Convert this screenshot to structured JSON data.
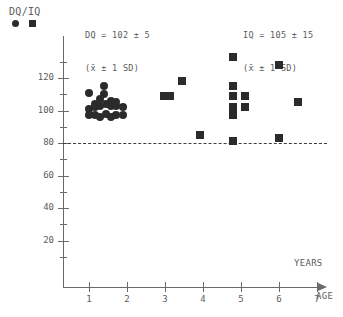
{
  "legend": {
    "title": "DQ/IQ",
    "circle_name": "circle-marker",
    "square_name": "square-marker"
  },
  "annotations": {
    "dq_line1": "DQ = 102 ± 5",
    "dq_line2": "(x̄ ± 1 SD)",
    "iq_line1": "IQ = 105 ± 15",
    "iq_line2": "(x̄ ± 1 SD)",
    "years_label": "YEARS",
    "age_label": "AGE"
  },
  "colors": {
    "marker": "#2b2b2b",
    "axis": "#6a6a6a",
    "text": "#5b5b5b",
    "reference_line": "#3d3d3d",
    "background": "#ffffff"
  },
  "chart_data": {
    "type": "scatter",
    "title": "",
    "xlabel": "AGE",
    "ylabel": "DQ/IQ",
    "xlim": [
      0,
      7.7
    ],
    "ylim": [
      0,
      136
    ],
    "grid": false,
    "legend_position": "top-left",
    "y_ticks_major": [
      20,
      40,
      60,
      80,
      100,
      120
    ],
    "y_ticks_minor": [
      10,
      30,
      50,
      70,
      90,
      110,
      130
    ],
    "x_ticks": [
      1,
      2,
      3,
      4,
      5,
      6,
      7
    ],
    "x_tick_labels": [
      "1",
      "2",
      "3",
      "4",
      "5",
      "6",
      "7"
    ],
    "y_tick_labels": [
      "20",
      "40",
      "60",
      "80",
      "100",
      "120"
    ],
    "reference_line": {
      "y": 80,
      "style": "dashed",
      "label": ""
    },
    "series": [
      {
        "name": "DQ",
        "marker": "circle",
        "mean": 102,
        "sd": 5,
        "points": [
          {
            "x": 1.0,
            "y": 111
          },
          {
            "x": 1.0,
            "y": 101
          },
          {
            "x": 1.0,
            "y": 97
          },
          {
            "x": 1.17,
            "y": 104
          },
          {
            "x": 1.17,
            "y": 102
          },
          {
            "x": 1.17,
            "y": 97
          },
          {
            "x": 1.3,
            "y": 107
          },
          {
            "x": 1.3,
            "y": 103
          },
          {
            "x": 1.3,
            "y": 96
          },
          {
            "x": 1.4,
            "y": 115
          },
          {
            "x": 1.4,
            "y": 110
          },
          {
            "x": 1.45,
            "y": 104
          },
          {
            "x": 1.45,
            "y": 98
          },
          {
            "x": 1.58,
            "y": 106
          },
          {
            "x": 1.58,
            "y": 103
          },
          {
            "x": 1.58,
            "y": 96
          },
          {
            "x": 1.72,
            "y": 105
          },
          {
            "x": 1.72,
            "y": 103
          },
          {
            "x": 1.72,
            "y": 97
          },
          {
            "x": 1.9,
            "y": 102
          },
          {
            "x": 1.9,
            "y": 97
          }
        ]
      },
      {
        "name": "IQ",
        "marker": "square",
        "mean": 105,
        "sd": 15,
        "points": [
          {
            "x": 2.98,
            "y": 109
          },
          {
            "x": 3.14,
            "y": 109
          },
          {
            "x": 3.45,
            "y": 118
          },
          {
            "x": 3.92,
            "y": 85
          },
          {
            "x": 4.8,
            "y": 133
          },
          {
            "x": 4.8,
            "y": 115
          },
          {
            "x": 4.8,
            "y": 109
          },
          {
            "x": 4.8,
            "y": 102
          },
          {
            "x": 4.8,
            "y": 97
          },
          {
            "x": 4.8,
            "y": 81
          },
          {
            "x": 5.1,
            "y": 109
          },
          {
            "x": 5.1,
            "y": 102
          },
          {
            "x": 6.0,
            "y": 128
          },
          {
            "x": 6.0,
            "y": 83
          },
          {
            "x": 6.5,
            "y": 105
          }
        ]
      }
    ]
  }
}
